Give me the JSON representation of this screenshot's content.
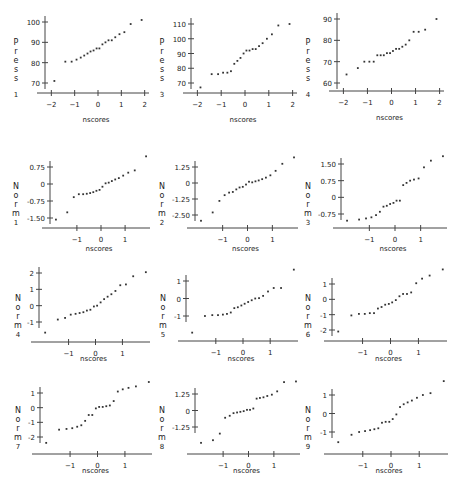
{
  "chart_data": [
    {
      "type": "scatter",
      "title": "",
      "xlabel": "nscores",
      "ylabel": "Press 1",
      "xticks": [
        -2,
        -1,
        0,
        1,
        2
      ],
      "yticks": [
        70,
        80,
        90,
        100
      ],
      "ytick_labels": [
        "70",
        "80",
        "90",
        "100"
      ],
      "xlim": [
        -2.1,
        2.1
      ],
      "ylim": [
        70,
        100
      ],
      "x": [
        -1.87,
        -1.4,
        -1.13,
        -0.92,
        -0.74,
        -0.59,
        -0.45,
        -0.32,
        -0.19,
        -0.06,
        0.06,
        0.19,
        0.32,
        0.45,
        0.59,
        0.74,
        0.92,
        1.13,
        1.4,
        1.87
      ],
      "y": [
        71,
        80.5,
        80.5,
        81.5,
        82.5,
        83.5,
        84.5,
        85.5,
        86,
        87,
        87,
        89,
        90,
        91,
        91,
        92.5,
        94,
        95,
        99,
        101
      ]
    },
    {
      "type": "scatter",
      "title": "",
      "xlabel": "nscores",
      "ylabel": "Press 3",
      "xticks": [
        -2,
        -1,
        0,
        1,
        2
      ],
      "yticks": [
        70,
        80,
        90,
        100,
        110
      ],
      "ytick_labels": [
        "70",
        "80",
        "90",
        "100",
        "110"
      ],
      "xlim": [
        -2.1,
        2.1
      ],
      "ylim": [
        70,
        110
      ],
      "x": [
        -1.87,
        -1.4,
        -1.13,
        -0.92,
        -0.74,
        -0.59,
        -0.45,
        -0.32,
        -0.19,
        -0.06,
        0.06,
        0.19,
        0.32,
        0.45,
        0.59,
        0.74,
        0.92,
        1.13,
        1.4,
        1.87
      ],
      "y": [
        67,
        76,
        76,
        77,
        77,
        78,
        83,
        85,
        87,
        90,
        92,
        92,
        93,
        93,
        95,
        97,
        100,
        103,
        109,
        110
      ]
    },
    {
      "type": "scatter",
      "title": "",
      "xlabel": "nscores",
      "ylabel": "Press 4",
      "xticks": [
        -2,
        -1,
        0,
        1,
        2
      ],
      "yticks": [
        60,
        70,
        80,
        90
      ],
      "ytick_labels": [
        "60",
        "70",
        "80",
        "90"
      ],
      "xlim": [
        -2.1,
        2.1
      ],
      "ylim": [
        60,
        90
      ],
      "x": [
        -1.87,
        -1.4,
        -1.13,
        -0.92,
        -0.74,
        -0.59,
        -0.45,
        -0.32,
        -0.19,
        -0.06,
        0.06,
        0.19,
        0.32,
        0.45,
        0.59,
        0.74,
        0.92,
        1.13,
        1.4,
        1.87
      ],
      "y": [
        64,
        67,
        70,
        70,
        70,
        73,
        73,
        73,
        74,
        74,
        75,
        76,
        76,
        77,
        78,
        80,
        84,
        84,
        85,
        90
      ]
    },
    {
      "type": "scatter",
      "title": "",
      "xlabel": "nscores",
      "ylabel": "Norm 1",
      "xticks": [
        -1,
        0,
        1
      ],
      "yticks": [
        -1.5,
        -0.75,
        0,
        0.75
      ],
      "ytick_labels": [
        "-1.50",
        "-0.75",
        "0",
        "0.75"
      ],
      "xlim": [
        -1.95,
        1.95
      ],
      "ylim": [
        -1.5,
        0.75
      ],
      "x": [
        -1.87,
        -1.4,
        -1.13,
        -0.92,
        -0.74,
        -0.59,
        -0.45,
        -0.32,
        -0.19,
        -0.06,
        0.06,
        0.19,
        0.32,
        0.45,
        0.59,
        0.74,
        0.92,
        1.13,
        1.4,
        1.87
      ],
      "y": [
        -1.57,
        -1.25,
        -0.58,
        -0.45,
        -0.45,
        -0.43,
        -0.4,
        -0.36,
        -0.3,
        -0.26,
        -0.12,
        0.03,
        0.06,
        0.13,
        0.2,
        0.26,
        0.37,
        0.5,
        0.6,
        1.22
      ]
    },
    {
      "type": "scatter",
      "title": "",
      "xlabel": "nscores",
      "ylabel": "Norm 2",
      "xticks": [
        -1,
        0,
        1
      ],
      "yticks": [
        -2.5,
        -1.25,
        0,
        1.25
      ],
      "ytick_labels": [
        "-2.50",
        "-1.25",
        "0",
        "1.25"
      ],
      "xlim": [
        -1.95,
        1.95
      ],
      "ylim": [
        -2.5,
        1.25
      ],
      "x": [
        -1.87,
        -1.4,
        -1.13,
        -0.92,
        -0.74,
        -0.59,
        -0.45,
        -0.32,
        -0.19,
        -0.06,
        0.06,
        0.19,
        0.32,
        0.45,
        0.59,
        0.74,
        0.92,
        1.13,
        1.4,
        1.87
      ],
      "y": [
        -2.95,
        -2.3,
        -1.4,
        -0.95,
        -0.75,
        -0.7,
        -0.5,
        -0.35,
        -0.3,
        -0.12,
        0.1,
        0.05,
        0.13,
        0.2,
        0.3,
        0.42,
        0.6,
        0.95,
        1.5,
        2.0
      ]
    },
    {
      "type": "scatter",
      "title": "",
      "xlabel": "nscores",
      "ylabel": "Norm 3",
      "xticks": [
        -1,
        0,
        1
      ],
      "yticks": [
        -0.75,
        0,
        0.75,
        1.5
      ],
      "ytick_labels": [
        "-0.75",
        "0",
        "0.75",
        "1.50"
      ],
      "xlim": [
        -1.95,
        1.95
      ],
      "ylim": [
        -0.75,
        1.5
      ],
      "x": [
        -1.87,
        -1.4,
        -1.13,
        -0.92,
        -0.74,
        -0.59,
        -0.45,
        -0.32,
        -0.19,
        -0.06,
        0.06,
        0.19,
        0.32,
        0.45,
        0.59,
        0.74,
        0.92,
        1.13,
        1.4,
        1.87
      ],
      "y": [
        -1.05,
        -1.0,
        -0.95,
        -0.9,
        -0.8,
        -0.65,
        -0.42,
        -0.38,
        -0.3,
        -0.25,
        -0.15,
        -0.15,
        0.55,
        0.65,
        0.75,
        0.8,
        0.85,
        1.35,
        1.65,
        1.85
      ]
    },
    {
      "type": "scatter",
      "title": "",
      "xlabel": "nscores",
      "ylabel": "Norm 4",
      "xticks": [
        -1,
        0,
        1
      ],
      "yticks": [
        -1,
        0,
        1,
        2
      ],
      "ytick_labels": [
        "-1",
        "0",
        "1",
        "2"
      ],
      "xlim": [
        -1.95,
        1.95
      ],
      "ylim": [
        -1,
        2
      ],
      "x": [
        -1.87,
        -1.4,
        -1.13,
        -0.92,
        -0.74,
        -0.59,
        -0.45,
        -0.32,
        -0.19,
        -0.06,
        0.06,
        0.19,
        0.32,
        0.45,
        0.59,
        0.74,
        0.92,
        1.13,
        1.4,
        1.87
      ],
      "y": [
        -1.65,
        -0.85,
        -0.75,
        -0.55,
        -0.5,
        -0.45,
        -0.4,
        -0.3,
        -0.25,
        -0.05,
        0.0,
        0.2,
        0.4,
        0.55,
        0.7,
        0.9,
        1.25,
        1.3,
        1.8,
        2.05
      ]
    },
    {
      "type": "scatter",
      "title": "",
      "xlabel": "nscores",
      "ylabel": "Norm 5",
      "xticks": [
        -1,
        0,
        1
      ],
      "yticks": [
        -1,
        0,
        1
      ],
      "ytick_labels": [
        "-1",
        "0",
        "1"
      ],
      "xlim": [
        -1.95,
        1.95
      ],
      "ylim": [
        -1,
        1
      ],
      "x": [
        -1.87,
        -1.4,
        -1.13,
        -0.92,
        -0.74,
        -0.59,
        -0.45,
        -0.32,
        -0.19,
        -0.06,
        0.06,
        0.19,
        0.32,
        0.45,
        0.59,
        0.74,
        0.92,
        1.13,
        1.4,
        1.87
      ],
      "y": [
        -1.95,
        -1.0,
        -0.95,
        -0.95,
        -0.92,
        -0.88,
        -0.8,
        -0.55,
        -0.5,
        -0.4,
        -0.3,
        -0.2,
        -0.1,
        0.0,
        0.02,
        0.15,
        0.4,
        0.6,
        0.6,
        1.65
      ]
    },
    {
      "type": "scatter",
      "title": "",
      "xlabel": "nscores",
      "ylabel": "Norm 6",
      "xticks": [
        -1,
        0,
        1
      ],
      "yticks": [
        -2,
        -1,
        0,
        1
      ],
      "ytick_labels": [
        "-2",
        "-1",
        "0",
        "1"
      ],
      "xlim": [
        -1.95,
        1.95
      ],
      "ylim": [
        -2,
        1
      ],
      "x": [
        -1.87,
        -1.4,
        -1.13,
        -0.92,
        -0.74,
        -0.59,
        -0.45,
        -0.32,
        -0.19,
        -0.06,
        0.06,
        0.19,
        0.32,
        0.45,
        0.59,
        0.74,
        0.92,
        1.13,
        1.4,
        1.87
      ],
      "y": [
        -2.1,
        -1.05,
        -0.95,
        -0.95,
        -0.9,
        -0.9,
        -0.6,
        -0.5,
        -0.35,
        -0.3,
        -0.2,
        -0.05,
        0.2,
        0.35,
        0.35,
        0.45,
        1.05,
        1.35,
        1.55,
        1.95
      ]
    },
    {
      "type": "scatter",
      "title": "",
      "xlabel": "nscores",
      "ylabel": "Norm 7",
      "xticks": [
        -1,
        0,
        1
      ],
      "yticks": [
        -2,
        -1,
        0,
        1
      ],
      "ytick_labels": [
        "-2",
        "-1",
        "0",
        "1"
      ],
      "xlim": [
        -1.95,
        1.95
      ],
      "ylim": [
        -2,
        1
      ],
      "x": [
        -1.87,
        -1.4,
        -1.13,
        -0.92,
        -0.74,
        -0.59,
        -0.45,
        -0.32,
        -0.19,
        -0.06,
        0.06,
        0.19,
        0.32,
        0.45,
        0.59,
        0.74,
        0.92,
        1.13,
        1.4,
        1.87
      ],
      "y": [
        -2.4,
        -1.5,
        -1.45,
        -1.4,
        -1.3,
        -1.2,
        -0.9,
        -0.5,
        -0.5,
        -0.05,
        0.05,
        0.05,
        0.1,
        0.15,
        0.45,
        1.1,
        1.25,
        1.35,
        1.45,
        1.75
      ]
    },
    {
      "type": "scatter",
      "title": "",
      "xlabel": "nscores",
      "ylabel": "Norm 8",
      "xticks": [
        -1,
        0,
        1
      ],
      "yticks": [
        -1.25,
        0,
        1.25
      ],
      "ytick_labels": [
        "-1.25",
        "0",
        "1.25"
      ],
      "xlim": [
        -1.95,
        1.95
      ],
      "ylim": [
        -1.25,
        1.25
      ],
      "x": [
        -1.87,
        -1.4,
        -1.13,
        -0.92,
        -0.74,
        -0.59,
        -0.45,
        -0.32,
        -0.19,
        -0.06,
        0.06,
        0.19,
        0.32,
        0.45,
        0.59,
        0.74,
        0.92,
        1.13,
        1.4,
        1.87
      ],
      "y": [
        -2.45,
        -2.25,
        -1.75,
        -0.55,
        -0.4,
        -0.2,
        -0.15,
        -0.1,
        -0.05,
        0.05,
        0.05,
        0.15,
        0.9,
        0.95,
        1.0,
        1.1,
        1.2,
        1.45,
        2.15,
        2.2
      ]
    },
    {
      "type": "scatter",
      "title": "",
      "xlabel": "nscores",
      "ylabel": "Norm 9",
      "xticks": [
        -1,
        0,
        1
      ],
      "yticks": [
        -1,
        0,
        1
      ],
      "ytick_labels": [
        "-1",
        "0",
        "1"
      ],
      "xlim": [
        -1.95,
        1.95
      ],
      "ylim": [
        -1,
        1
      ],
      "x": [
        -1.87,
        -1.4,
        -1.13,
        -0.92,
        -0.74,
        -0.59,
        -0.45,
        -0.32,
        -0.19,
        -0.06,
        0.06,
        0.19,
        0.32,
        0.45,
        0.59,
        0.74,
        0.92,
        1.13,
        1.4,
        1.87
      ],
      "y": [
        -1.55,
        -1.15,
        -1.0,
        -0.95,
        -0.9,
        -0.85,
        -0.8,
        -0.5,
        -0.45,
        -0.45,
        -0.3,
        -0.05,
        0.35,
        0.5,
        0.6,
        0.7,
        0.85,
        1.0,
        1.1,
        1.75
      ]
    }
  ],
  "panels": [
    {
      "x": 0,
      "y": 0,
      "w": 152,
      "h": 135,
      "plot": {
        "left": 45,
        "right": 147,
        "top": 22,
        "bottom": 83,
        "xaxis_y": 93,
        "yaxis_x": 45,
        "xlabel_y": 130,
        "ylabel_x": 16,
        "ylabel_top": 45
      }
    },
    {
      "x": 150,
      "y": 0,
      "w": 152,
      "h": 135,
      "plot": {
        "left": 41,
        "right": 145,
        "top": 24,
        "bottom": 83,
        "xaxis_y": 93,
        "yaxis_x": 41,
        "xlabel_y": 130,
        "ylabel_x": 12,
        "ylabel_top": 45
      }
    },
    {
      "x": 300,
      "y": 0,
      "w": 155,
      "h": 135,
      "plot": {
        "left": 37,
        "right": 142,
        "top": 19,
        "bottom": 83,
        "xaxis_y": 91,
        "yaxis_x": 37,
        "xlabel_y": 128,
        "ylabel_x": 8,
        "ylabel_top": 45
      }
    },
    {
      "x": 0,
      "y": 148,
      "w": 152,
      "h": 125,
      "plot": {
        "left": 50,
        "right": 148,
        "top": 19,
        "bottom": 70,
        "xaxis_y": 80,
        "yaxis_x": 50,
        "xlabel_y": 111,
        "ylabel_x": 16,
        "ylabel_top": 41
      }
    },
    {
      "x": 150,
      "y": 148,
      "w": 152,
      "h": 125,
      "plot": {
        "left": 45,
        "right": 146,
        "top": 19,
        "bottom": 67,
        "xaxis_y": 80,
        "yaxis_x": 45,
        "xlabel_y": 111,
        "ylabel_x": 12,
        "ylabel_top": 41
      }
    },
    {
      "x": 300,
      "y": 148,
      "w": 155,
      "h": 125,
      "plot": {
        "left": 41,
        "right": 145,
        "top": 16,
        "bottom": 66,
        "xaxis_y": 80,
        "yaxis_x": 41,
        "xlabel_y": 111,
        "ylabel_x": 8,
        "ylabel_top": 41
      }
    },
    {
      "x": 0,
      "y": 265,
      "w": 152,
      "h": 115,
      "plot": {
        "left": 39,
        "right": 148,
        "top": 8,
        "bottom": 57,
        "xaxis_y": 77,
        "yaxis_x": 39,
        "xlabel_y": 104,
        "ylabel_x": 18,
        "ylabel_top": 36
      }
    },
    {
      "x": 150,
      "y": 265,
      "w": 152,
      "h": 115,
      "plot": {
        "left": 36,
        "right": 146,
        "top": 16,
        "bottom": 51,
        "xaxis_y": 76,
        "yaxis_x": 36,
        "xlabel_y": 104,
        "ylabel_x": 13,
        "ylabel_top": 36
      }
    },
    {
      "x": 300,
      "y": 265,
      "w": 155,
      "h": 115,
      "plot": {
        "left": 32,
        "right": 145,
        "top": 19,
        "bottom": 65,
        "xaxis_y": 76,
        "yaxis_x": 32,
        "xlabel_y": 104,
        "ylabel_x": 8,
        "ylabel_top": 36
      }
    },
    {
      "x": 0,
      "y": 375,
      "w": 152,
      "h": 120,
      "plot": {
        "left": 40,
        "right": 151,
        "top": 18,
        "bottom": 62,
        "xaxis_y": 79,
        "yaxis_x": 40,
        "xlabel_y": 106,
        "ylabel_x": 18,
        "ylabel_top": 38
      }
    },
    {
      "x": 150,
      "y": 375,
      "w": 152,
      "h": 120,
      "plot": {
        "left": 45,
        "right": 148,
        "top": 19,
        "bottom": 52,
        "xaxis_y": 79,
        "yaxis_x": 45,
        "xlabel_y": 106,
        "ylabel_x": 12,
        "ylabel_top": 38
      }
    },
    {
      "x": 300,
      "y": 375,
      "w": 155,
      "h": 120,
      "plot": {
        "left": 32,
        "right": 146,
        "top": 20,
        "bottom": 57,
        "xaxis_y": 79,
        "yaxis_x": 32,
        "xlabel_y": 106,
        "ylabel_x": 8,
        "ylabel_top": 38
      }
    }
  ],
  "style": {
    "point_color": "#333333",
    "axis_color": "#444444",
    "text_color": "#222222"
  }
}
